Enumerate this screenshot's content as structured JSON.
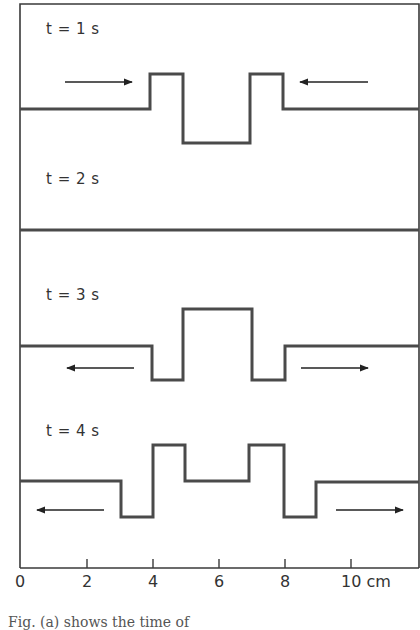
{
  "figure": {
    "frame": {
      "left": 20,
      "top": 4,
      "right": 419,
      "bottom": 568
    },
    "axis": {
      "unit": "cm",
      "ticks": [
        {
          "value": 0,
          "label": "0",
          "x": 20
        },
        {
          "value": 2,
          "label": "2",
          "x": 87
        },
        {
          "value": 4,
          "label": "4",
          "x": 153
        },
        {
          "value": 6,
          "label": "6",
          "x": 219
        },
        {
          "value": 8,
          "label": "8",
          "x": 285
        },
        {
          "value": 10,
          "label": "10 cm",
          "x": 351
        }
      ]
    },
    "panels": [
      {
        "label": "t = 1 s",
        "label_pos": {
          "x": 46,
          "y": 26
        },
        "waveform_points": "20,109 150,109 150,74 183,74 183,143 250,143 250,74 283,74 283,109 419,109",
        "arrows": [
          {
            "direction": "right",
            "x1": 65,
            "x2": 132,
            "y": 82
          },
          {
            "direction": "left",
            "x1": 368,
            "x2": 300,
            "y": 82
          }
        ]
      },
      {
        "label": "t = 2 s",
        "label_pos": {
          "x": 46,
          "y": 176
        },
        "waveform_points": "20,230 419,230",
        "arrows": []
      },
      {
        "label": "t = 3 s",
        "label_pos": {
          "x": 46,
          "y": 292
        },
        "waveform_points": "20,346 152,346 152,380 183,380 183,309 252,309 252,380 285,380 285,346 419,346",
        "arrows": [
          {
            "direction": "left",
            "x1": 134,
            "x2": 67,
            "y": 368
          },
          {
            "direction": "right",
            "x1": 301,
            "x2": 368,
            "y": 368
          }
        ]
      },
      {
        "label": "t = 4 s",
        "label_pos": {
          "x": 46,
          "y": 428
        },
        "waveform_points": "20,481 121,481 121,517 153,517 153,445 185,445 185,481 249,481 249,445 284,445 284,517 316,517 316,482 419,482",
        "arrows": [
          {
            "direction": "left",
            "x1": 104,
            "x2": 37,
            "y": 510
          },
          {
            "direction": "right",
            "x1": 336,
            "x2": 403,
            "y": 510
          }
        ]
      }
    ],
    "caption": "Fig. (a) shows the time of"
  }
}
